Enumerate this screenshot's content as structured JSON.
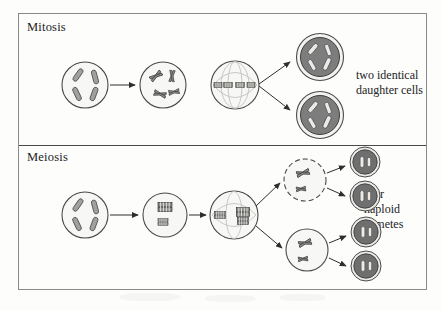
{
  "figure": {
    "type": "diagram",
    "sections": [
      {
        "id": "mitosis",
        "label": "Mitosis",
        "caption_lines": [
          "two identical",
          "daughter cells"
        ],
        "outcome_count": 2,
        "stages": [
          {
            "name": "parent-cell",
            "chromosomes": 4,
            "chromosome_form": "rod",
            "fill": "#f7f7f5"
          },
          {
            "name": "replicated-chromosomes-cell",
            "chromosomes": 4,
            "chromosome_form": "duplicated",
            "fill": "#f7f7f5"
          },
          {
            "name": "metaphase-spindle-cell",
            "chromosomes": 4,
            "chromosome_form": "aligned-plate",
            "fill": "#f7f7f5"
          },
          {
            "name": "daughter-cell-top",
            "chromosomes": 4,
            "chromosome_form": "rod",
            "fill": "#7d7d7d"
          },
          {
            "name": "daughter-cell-bottom",
            "chromosomes": 4,
            "chromosome_form": "rod",
            "fill": "#7d7d7d"
          }
        ]
      },
      {
        "id": "meiosis",
        "label": "Meiosis",
        "caption_lines": [
          "four",
          "haploid",
          "gametes"
        ],
        "outcome_count": 4,
        "stages": [
          {
            "name": "parent-cell",
            "chromosomes": 4,
            "chromosome_form": "rod",
            "fill": "#f7f7f5"
          },
          {
            "name": "paired-tetrad-cell",
            "chromosomes": 2,
            "chromosome_form": "tetrad",
            "fill": "#f7f7f5"
          },
          {
            "name": "metaphase-i-spindle-cell",
            "chromosomes": 2,
            "chromosome_form": "tetrad-plate",
            "fill": "#f7f7f5"
          },
          {
            "name": "intermediate-cell-top",
            "chromosomes": 2,
            "chromosome_form": "duplicated",
            "fill": "#f7f7f5"
          },
          {
            "name": "intermediate-cell-bottom",
            "chromosomes": 2,
            "chromosome_form": "duplicated",
            "fill": "#f7f7f5"
          },
          {
            "name": "gamete-1",
            "chromosomes": 2,
            "chromosome_form": "rod",
            "fill": "#6f6f6f"
          },
          {
            "name": "gamete-2",
            "chromosomes": 2,
            "chromosome_form": "rod",
            "fill": "#6f6f6f"
          },
          {
            "name": "gamete-3",
            "chromosomes": 2,
            "chromosome_form": "rod",
            "fill": "#6f6f6f"
          },
          {
            "name": "gamete-4",
            "chromosomes": 2,
            "chromosome_form": "rod",
            "fill": "#6f6f6f"
          }
        ]
      }
    ]
  },
  "colors": {
    "page_background": "#fdfdfc",
    "frame_border": "#8a8a8a",
    "divider": "#4a4a4a",
    "text": "#232323",
    "cell_outline": "#4a4a4a",
    "cell_light_fill": "#f7f7f5",
    "cell_dark_fill": "#7d7d7d",
    "gamete_dark_fill": "#6f6f6f",
    "chromosome_dark": "#9a9a9a",
    "chromosome_outline": "#3c3c3c",
    "chromosome_light": "#ededea",
    "spindle_fiber": "#bdbdbd",
    "arrow": "#2e2e2e"
  }
}
